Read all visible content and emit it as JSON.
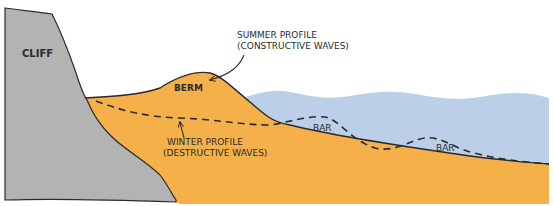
{
  "diagram": {
    "labels": {
      "cliff": "CLIFF",
      "berm": "BERM",
      "bar_1": "BAR",
      "bar_2": "BAR",
      "summer_profile_line1": "SUMMER PROFILE",
      "summer_profile_line2": "(CONSTRUCTIVE WAVES)",
      "winter_profile_line1": "WINTER PROFILE",
      "winter_profile_line2": "(DESTRUCTIVE WAVES)"
    },
    "colors": {
      "cliff": "#b3b3b3",
      "sand": "#f5b04a",
      "water": "#bccfe9",
      "outline": "#2b2b2b",
      "background": "#ffffff"
    },
    "legend": [
      {
        "name": "Summer profile",
        "style": "solid line",
        "meaning": "constructive waves"
      },
      {
        "name": "Winter profile",
        "style": "dashed line",
        "meaning": "destructive waves"
      }
    ]
  }
}
